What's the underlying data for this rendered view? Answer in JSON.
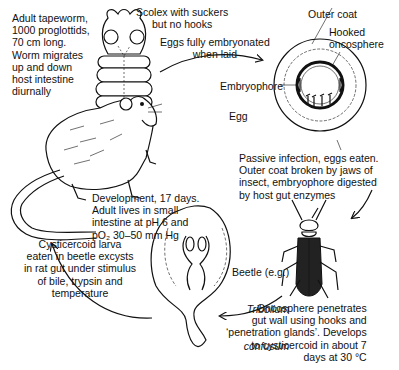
{
  "diagram": {
    "title": "",
    "type": "life-cycle",
    "organism": "Hymenolepis diminuta (rat tapeworm)",
    "stages": {
      "adult": {
        "label": "Adult tapeworm,\n1000 proglottids,\n70 cm long.\nWorm migrates\nup and down\nhost intestine\ndiurnally"
      },
      "scolex": {
        "label": "Scolex with suckers\nbut no hooks"
      },
      "eggs_laid": {
        "label": "Eggs fully embryonated\nwhen laid"
      },
      "egg": {
        "label": "Egg",
        "parts": {
          "outer_coat": "Outer coat",
          "hooked_oncosphere": "Hooked\noncosphere",
          "embryophore": "Embryophore"
        }
      },
      "passive_infection": {
        "label": "Passive infection, eggs eaten.\nOuter coat broken by jaws of\ninsect, embryophore digested\nby host gut enzymes"
      },
      "beetle": {
        "label_prefix": "Beetle (e.g.)",
        "species_line1": "Tribolium",
        "species_line2": "confusum"
      },
      "oncosphere_penetrates": {
        "label": "Oncosphere penetrates\ngut wall using hooks and\n‘penetration glands’. Develops\nto cysticercoid in about 7\ndays at 30 °C"
      },
      "cysticercoid": {
        "label": "Cysticercoid larva\neaten in beetle excysts\nin rat gut under stimulus\nof bile, trypsin and\ntemperature"
      },
      "development": {
        "label": "Development, 17 days.\nAdult lives in small\nintestine at pH 6 and\npO₂ 30–50 mm Hg"
      }
    },
    "hosts": [
      "rat",
      "beetle"
    ]
  }
}
